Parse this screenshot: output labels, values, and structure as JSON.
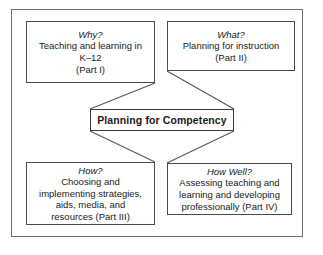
{
  "diagram": {
    "type": "concept-map",
    "frame_color": "#6e6e6e",
    "node_border_color": "#4a4a4a",
    "background": "#ffffff",
    "center": {
      "label": "Planning for Competency"
    },
    "nodes": [
      {
        "id": "why",
        "question": "Why?",
        "lines": [
          "Teaching and learning in",
          "K–12",
          "(Part I)"
        ],
        "part": "Part I"
      },
      {
        "id": "what",
        "question": "What?",
        "lines": [
          "Planning for instruction",
          "(Part II)"
        ],
        "part": "Part II"
      },
      {
        "id": "how",
        "question": "How?",
        "lines": [
          "Choosing and",
          "implementing strategies,",
          "aids, media, and",
          "resources (Part III)"
        ],
        "part": "Part III"
      },
      {
        "id": "how-well",
        "question": "How Well?",
        "lines": [
          "Assessing teaching and",
          "learning and developing",
          "professionally (Part IV)"
        ],
        "part": "Part IV"
      }
    ]
  }
}
